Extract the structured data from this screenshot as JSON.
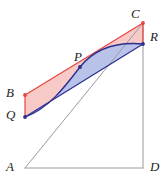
{
  "figure": {
    "background_color": "#ffffff",
    "canvas": {
      "width": 166,
      "height": 192
    },
    "colors": {
      "frame_stroke": "#9a9aa2",
      "red_stroke": "#e8453c",
      "red_fill": "#f7c9c7",
      "blue_stroke": "#2b2f8f",
      "blue_fill": "#b9c2e9",
      "label_text": "#231f20",
      "vertex_red": "#e8453c",
      "vertex_blue": "#2b2f8f"
    },
    "points": [
      {
        "id": "A",
        "label": "A",
        "x": 25,
        "y": 168,
        "label_x": 6,
        "label_y": 160,
        "dot": false,
        "dot_color": ""
      },
      {
        "id": "B",
        "label": "B",
        "x": 25,
        "y": 95,
        "label_x": 6,
        "label_y": 86,
        "dot": true,
        "dot_color": "#e8453c"
      },
      {
        "id": "C",
        "label": "C",
        "x": 143,
        "y": 23,
        "label_x": 131,
        "label_y": 7,
        "dot": true,
        "dot_color": "#e8453c"
      },
      {
        "id": "D",
        "label": "D",
        "x": 143,
        "y": 168,
        "label_x": 150,
        "label_y": 160,
        "dot": false,
        "dot_color": ""
      },
      {
        "id": "P",
        "label": "P",
        "x": 80,
        "y": 67,
        "label_x": 74,
        "label_y": 50,
        "dot": true,
        "dot_color": "#2b2f8f"
      },
      {
        "id": "Q",
        "label": "Q",
        "x": 25,
        "y": 117,
        "label_x": 6,
        "label_y": 108,
        "dot": true,
        "dot_color": "#2b2f8f"
      },
      {
        "id": "R",
        "label": "R",
        "x": 143,
        "y": 44,
        "label_x": 150,
        "label_y": 30,
        "dot": true,
        "dot_color": "#2b2f8f"
      }
    ],
    "segments": [
      {
        "id": "frame-left",
        "name": "segment-AB-left-edge",
        "from": "A",
        "to": "C",
        "color": "#9a9aa2"
      },
      {
        "id": "frame-bottom",
        "name": "segment-AD-bottom-edge",
        "from": "A",
        "to": "D",
        "color": "#9a9aa2"
      },
      {
        "id": "frame-right",
        "name": "segment-DC-right-edge",
        "from": "D",
        "to": "C",
        "color": "#9a9aa2"
      },
      {
        "id": "line-BC",
        "name": "segment-BC",
        "from": "B",
        "to": "C",
        "color": "#e8453c"
      },
      {
        "id": "line-QR",
        "name": "segment-QR-chord",
        "from": "Q",
        "to": "R",
        "color": "#2b2f8f"
      },
      {
        "id": "line-BQ",
        "name": "segment-BQ",
        "from": "B",
        "to": "Q",
        "color": "#e8453c"
      },
      {
        "id": "line-CR",
        "name": "segment-CR",
        "from": "C",
        "to": "R",
        "color": "#e8453c"
      }
    ],
    "curve": {
      "name": "arc-QPR",
      "color": "#2b2f8f",
      "path": "M 25 117 C 48 109 64 88 80 67 C 96 47 120 42 143 44"
    },
    "regions": [
      {
        "id": "red-region",
        "name": "region-red-between-BC-and-arc",
        "fill": "#f7c9c7",
        "path": "M 25 95 L 143 23 L 143 44 C 120 42 96 47 80 67 C 64 88 48 109 25 117 Z"
      },
      {
        "id": "blue-region",
        "name": "region-blue-between-arc-and-chord",
        "fill": "#b9c2e9",
        "path": "M 25 117 C 48 109 64 88 80 67 C 96 47 120 42 143 44 L 25 117 Z"
      }
    ]
  }
}
